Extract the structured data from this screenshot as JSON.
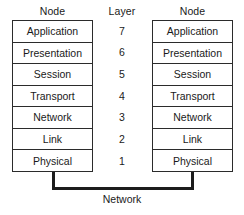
{
  "diagram": {
    "colors": {
      "background": "#ffffff",
      "box_border": "#2b2b2b",
      "connector": "#1c1c1c",
      "text": "#1a1a1a"
    },
    "headers": {
      "node_left": "Node",
      "layer": "Layer",
      "node_right": "Node"
    },
    "layers": [
      {
        "number": "7",
        "name": "Application"
      },
      {
        "number": "6",
        "name": "Presentation"
      },
      {
        "number": "5",
        "name": "Session"
      },
      {
        "number": "4",
        "name": "Transport"
      },
      {
        "number": "3",
        "name": "Network"
      },
      {
        "number": "2",
        "name": "Link"
      },
      {
        "number": "1",
        "name": "Physical"
      }
    ],
    "left_node": {
      "cells": [
        "Application",
        "Presentation",
        "Session",
        "Transport",
        "Network",
        "Link",
        "Physical"
      ]
    },
    "right_node": {
      "cells": [
        "Application",
        "Presentation",
        "Session",
        "Transport",
        "Network",
        "Link",
        "Physical"
      ]
    },
    "layer_numbers": [
      "7",
      "6",
      "5",
      "4",
      "3",
      "2",
      "1"
    ],
    "connector_label": "Network"
  }
}
